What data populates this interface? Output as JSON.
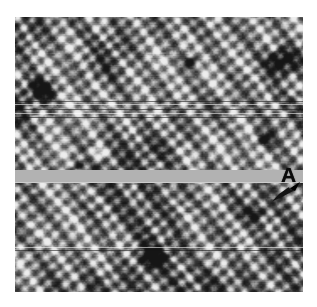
{
  "figure": {
    "kind": "scanning-probe-micrograph",
    "modality": "STM topograph",
    "colormap": "grayscale",
    "canvas": {
      "x": 15,
      "y": 17,
      "width": 288,
      "height": 275
    },
    "background_color": "#ffffff",
    "mean_gray": "#8a8a8a"
  },
  "annotations": {
    "label_a": {
      "text": "A",
      "color": "#0a0a0a",
      "x": 266,
      "y": 147
    },
    "arrow": {
      "name": "arrow-marker",
      "color": "#111111",
      "direction": "up-right",
      "x": 255,
      "y": 164
    }
  },
  "surface": {
    "lattice": {
      "type": "quasi-square-granular",
      "spacing_px": 11.5,
      "row_angle_deg": -38,
      "superstructure_spacing_px": 33
    },
    "defects": [
      {
        "name": "dark-defect-upper-left",
        "cx": 28,
        "cy": 72,
        "rx": 14,
        "ry": 11,
        "depth": 0.78
      },
      {
        "name": "dark-defect-upper-right",
        "cx": 266,
        "cy": 44,
        "rx": 16,
        "ry": 13,
        "depth": 0.8
      },
      {
        "name": "dark-defect-upper-mid",
        "cx": 176,
        "cy": 44,
        "rx": 8,
        "ry": 7,
        "depth": 0.55
      },
      {
        "name": "dark-defect-mid-right",
        "cx": 249,
        "cy": 122,
        "rx": 9,
        "ry": 8,
        "depth": 0.58
      },
      {
        "name": "dark-defect-lower-mid",
        "cx": 138,
        "cy": 240,
        "rx": 13,
        "ry": 10,
        "depth": 0.72
      },
      {
        "name": "dark-defect-lower-right",
        "cx": 240,
        "cy": 196,
        "rx": 9,
        "ry": 8,
        "depth": 0.5
      },
      {
        "name": "dark-defect-left-mid",
        "cx": 60,
        "cy": 148,
        "rx": 8,
        "ry": 7,
        "depth": 0.48
      },
      {
        "name": "bright-defect-left",
        "cx": 82,
        "cy": 136,
        "rx": 9,
        "ry": 7,
        "depth": -0.55
      }
    ],
    "gray_band": {
      "name": "flat-gray-band",
      "color": "#b2b2b2",
      "y": 153,
      "height": 13
    },
    "scanlines": [
      {
        "y": 84,
        "height": 1,
        "tone": "dark"
      },
      {
        "y": 87,
        "height": 1,
        "tone": "light"
      },
      {
        "y": 92,
        "height": 1,
        "tone": "dark"
      },
      {
        "y": 96,
        "height": 1,
        "tone": "light"
      },
      {
        "y": 100,
        "height": 1,
        "tone": "dark"
      },
      {
        "y": 230,
        "height": 1,
        "tone": "light"
      },
      {
        "y": 233,
        "height": 1,
        "tone": "dark"
      }
    ]
  },
  "chart_data": {
    "type": "heatmap",
    "title": "",
    "xlabel": "",
    "ylabel": "",
    "colorbar": {
      "min_label": "",
      "max_label": "",
      "units": ""
    },
    "grid": false,
    "legend": "none"
  }
}
